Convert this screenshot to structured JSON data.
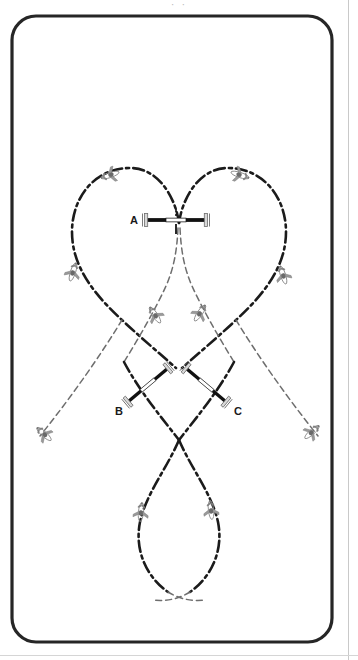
{
  "figure": {
    "title_clipped": "· ·",
    "frame": {
      "shape": "rounded-rectangle",
      "x": 12,
      "y": 16,
      "width": 320,
      "height": 626,
      "radius": 24,
      "stroke_color": "#262626",
      "stroke_width": 3.2
    },
    "page": {
      "background": "#ffffff",
      "edge_line_color": "#c9c9c9",
      "right_edge_x": 348,
      "bottom_rule_y": 655
    },
    "colors": {
      "path_dark": "#1b1b1b",
      "path_light": "#6e6e6e",
      "gate_bar": "#111111",
      "gate_post": "#9a9a9a",
      "aircraft": "#8a8a8a",
      "label_text": "#1a1a1a"
    },
    "gates": [
      {
        "id": "A",
        "label": "A",
        "label_x": 130,
        "label_y": 215,
        "cx": 176,
        "cy": 220,
        "length": 70,
        "angle_deg": 0,
        "center_tick": true
      },
      {
        "id": "B",
        "label": "B",
        "label_x": 115,
        "label_y": 406,
        "cx": 148,
        "cy": 385,
        "length": 62,
        "angle_deg": -40,
        "center_tick": false
      },
      {
        "id": "C",
        "label": "C",
        "label_x": 234,
        "label_y": 406,
        "cx": 206,
        "cy": 385,
        "length": 62,
        "angle_deg": 40,
        "center_tick": false
      }
    ],
    "paths": [
      {
        "name": "heart-left-lobe",
        "style": "dash-dot",
        "d": "M 179 223 C 176 200 160 168 130 168 C 96 168 72 196 72 232 C 72 268 96 296 122 320 C 140 337 158 352 176 368"
      },
      {
        "name": "heart-right-lobe",
        "style": "dash-dot",
        "d": "M 179 223 C 182 200 198 168 228 168 C 262 168 286 196 286 232 C 286 268 262 296 236 320 C 218 337 200 352 182 368"
      },
      {
        "name": "centre-descent-left",
        "style": "dash-fine",
        "d": "M 178 228 C 177 250 174 268 166 286 C 156 308 140 336 124 362"
      },
      {
        "name": "centre-descent-right",
        "style": "dash-fine",
        "d": "M 180 228 C 181 250 184 268 192 286 C 202 308 218 336 234 362"
      },
      {
        "name": "diagonal-left-out",
        "style": "dash-fine",
        "d": "M 122 320 C 100 356 72 396 40 436"
      },
      {
        "name": "diagonal-right-out",
        "style": "dash-fine",
        "d": "M 236 320 C 258 356 286 396 318 436"
      },
      {
        "name": "cross-left-down",
        "style": "dash-dot",
        "d": "M 124 362 C 140 392 162 418 179 440"
      },
      {
        "name": "cross-right-down",
        "style": "dash-dot",
        "d": "M 234 362 C 218 392 196 418 179 440"
      },
      {
        "name": "lower-loop-left",
        "style": "dash-dot",
        "d": "M 179 440 C 166 470 146 494 140 522 C 134 552 148 578 168 592"
      },
      {
        "name": "lower-loop-right",
        "style": "dash-dot",
        "d": "M 179 440 C 192 470 212 494 218 522 C 224 552 210 578 190 592"
      },
      {
        "name": "lower-tail-left",
        "style": "dash-fine",
        "d": "M 190 592 C 180 598 168 602 152 600"
      },
      {
        "name": "lower-tail-right",
        "style": "dash-fine",
        "d": "M 168 592 C 178 598 190 602 206 600"
      }
    ],
    "aircraft": [
      {
        "name": "ac-top-left",
        "x": 110,
        "y": 175,
        "angle": -18
      },
      {
        "name": "ac-top-right",
        "x": 240,
        "y": 175,
        "angle": 198
      },
      {
        "name": "ac-mid-left",
        "x": 73,
        "y": 272,
        "angle": 108
      },
      {
        "name": "ac-mid-right",
        "x": 283,
        "y": 275,
        "angle": 72
      },
      {
        "name": "ac-inner-left",
        "x": 155,
        "y": 315,
        "angle": 56
      },
      {
        "name": "ac-inner-right",
        "x": 200,
        "y": 313,
        "angle": 124
      },
      {
        "name": "ac-far-left",
        "x": 44,
        "y": 434,
        "angle": 42
      },
      {
        "name": "ac-far-right",
        "x": 312,
        "y": 432,
        "angle": 138
      },
      {
        "name": "ac-bottom-left",
        "x": 141,
        "y": 512,
        "angle": 96
      },
      {
        "name": "ac-bottom-right",
        "x": 211,
        "y": 510,
        "angle": 84
      }
    ]
  }
}
